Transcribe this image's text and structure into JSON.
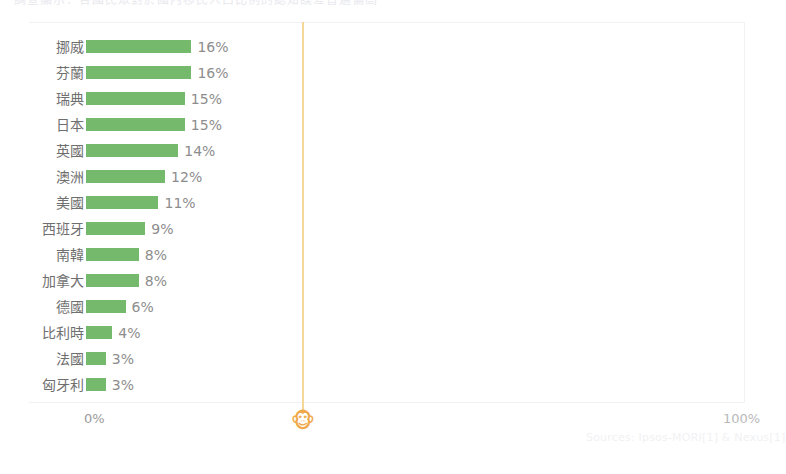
{
  "clipped_headline": "調查顯示：各國民眾對於國內移民人口比例的認知誤差普遍偏高",
  "chart_card": {
    "axis": {
      "left_label": "0%",
      "right_label": "100%"
    },
    "reference_marker": {
      "icon": "monkey-face-icon",
      "glyph": "🐵",
      "color": "#efa94a"
    },
    "bar_color": "#74b96c"
  },
  "source_note": "Sources: Ipsos-MORI[1] & Nexus[1]",
  "chart_data": {
    "type": "bar",
    "orientation": "horizontal",
    "title": "",
    "xlabel": "",
    "ylabel": "",
    "xlim": [
      0,
      100
    ],
    "grid": false,
    "legend": "none",
    "value_suffix": "%",
    "categories": [
      "挪威",
      "芬蘭",
      "瑞典",
      "日本",
      "英國",
      "澳洲",
      "美國",
      "西班牙",
      "南韓",
      "加拿大",
      "德國",
      "比利時",
      "法國",
      "匈牙利"
    ],
    "values": [
      16,
      16,
      15,
      15,
      14,
      12,
      11,
      9,
      8,
      8,
      6,
      4,
      3,
      3
    ],
    "labels": [
      "16%",
      "16%",
      "15%",
      "15%",
      "14%",
      "12%",
      "11%",
      "9%",
      "8%",
      "8%",
      "6%",
      "4%",
      "3%",
      "3%"
    ],
    "annotations": [
      {
        "name": "reference-line",
        "x": 33,
        "color": "#f6d79a"
      }
    ]
  }
}
